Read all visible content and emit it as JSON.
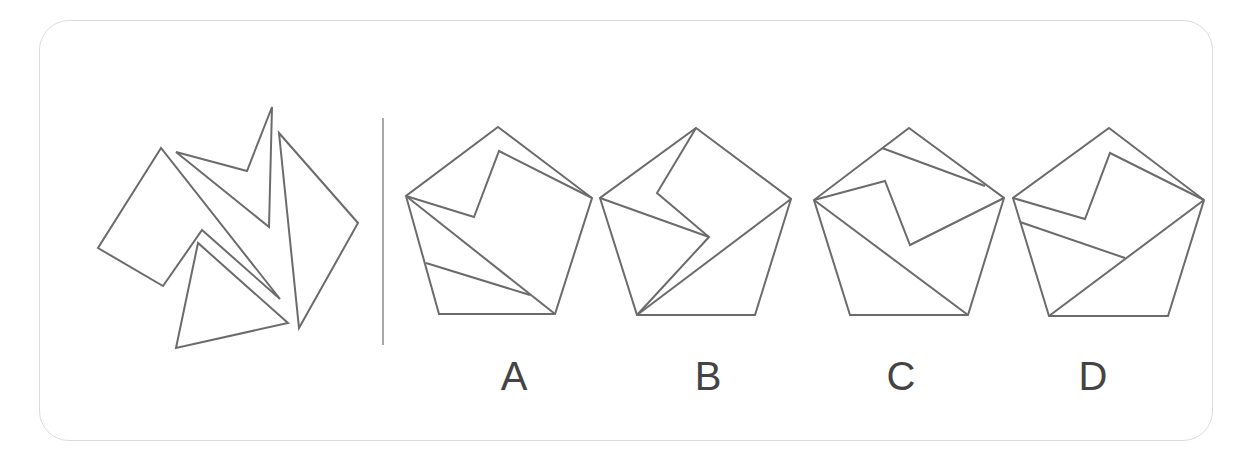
{
  "puzzle": {
    "type": "figure-assembly",
    "description": "Which pentagon can be composed from the four pieces on the left?",
    "pieces": [
      {
        "name": "piece-1",
        "points": "161,148 98,248 163,286 202,230 280,299"
      },
      {
        "name": "piece-2",
        "points": "176,152 247,171 272,107 269,227"
      },
      {
        "name": "piece-3",
        "points": "198,243 176,348 288,323"
      },
      {
        "name": "piece-4",
        "points": "279,133 358,223 299,328"
      }
    ],
    "options": [
      {
        "label": "A",
        "x": 514,
        "outline": "498,127 592,198 555,314 439,314 406,196",
        "lines": [
          "406,196 474,217 499,151 592,198",
          "406,196 555,314",
          "426,263 530,295"
        ]
      },
      {
        "label": "B",
        "x": 708,
        "outline": "696,128 791,199 755,315 637,315 600,198",
        "lines": [
          "696,128 657,193 709,237 637,315",
          "600,198 709,237",
          "791,199 637,315"
        ]
      },
      {
        "label": "C",
        "x": 901,
        "outline": "909,128 1004,198 968,315 850,315 814,200",
        "lines": [
          "882,148 985,186",
          "814,200 885,181 910,245 1004,198",
          "814,200 968,315"
        ]
      },
      {
        "label": "D",
        "x": 1093,
        "outline": "1109,128 1204,200 1168,316 1049,316 1013,198",
        "lines": [
          "1013,198 1085,219 1110,153 1204,200",
          "1020,222 1125,258",
          "1204,200 1049,316"
        ]
      }
    ],
    "colors": {
      "stroke": "#6b6b6b",
      "divider": "#a8a8a8",
      "border": "#dcdcdc",
      "label": "#444444"
    }
  }
}
